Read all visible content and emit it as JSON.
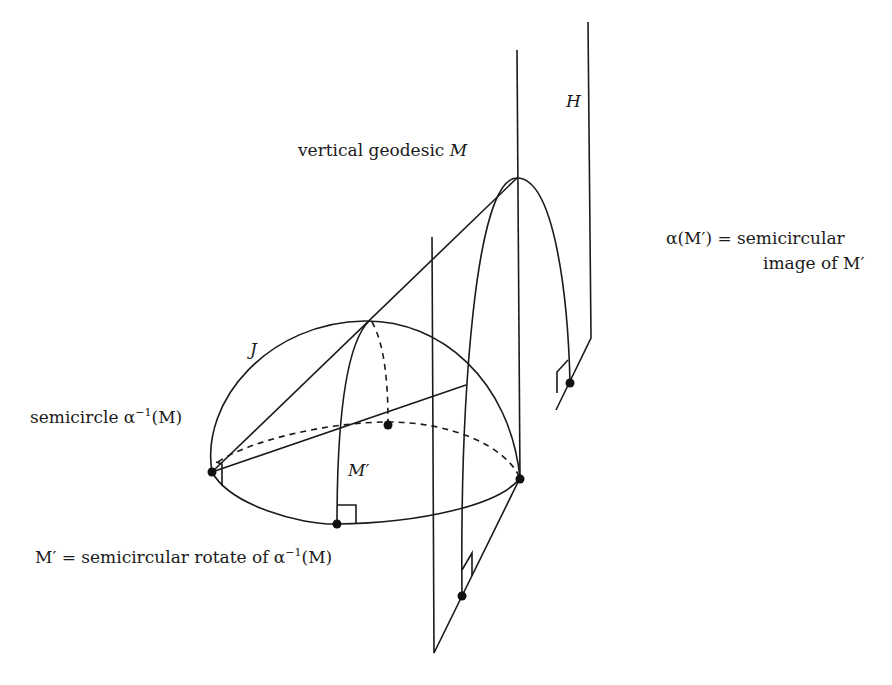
{
  "diagram": {
    "type": "geometric-3d-hyperbolic-geodesics",
    "labels": {
      "H": "H",
      "vertical_geodesic": "vertical geodesic ",
      "vertical_geodesic_var": "M",
      "alpha_M_prime_line1": "α(M′) = semicircular",
      "alpha_M_prime_line2": "image of M′",
      "J": "J",
      "semicircle_inverse": "semicircle α",
      "semicircle_inverse_sup": "−1",
      "semicircle_inverse_arg": "(M)",
      "M_prime": "M′",
      "M_prime_def_prefix": "M′ = semicircular rotate of α",
      "M_prime_def_sup": "−1",
      "M_prime_def_arg": "(M)"
    },
    "colors": {
      "stroke": "#1a1a1a",
      "background": "#ffffff"
    }
  }
}
